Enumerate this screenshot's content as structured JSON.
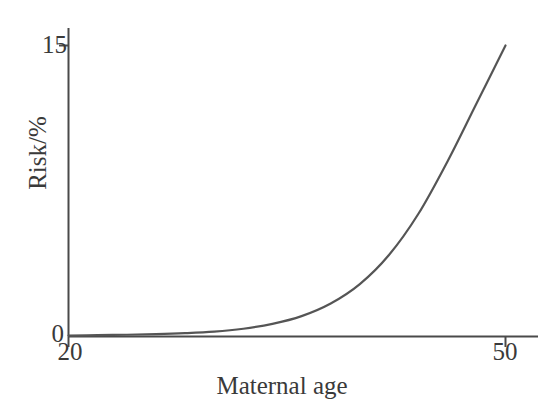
{
  "figure": {
    "width": 554,
    "height": 420,
    "background_color": "#ffffff",
    "axis_color": "#4a4a4a",
    "text_color": "#3a3a3a"
  },
  "chart_data": {
    "type": "line",
    "title": "",
    "subtitle": "",
    "xlabel": "Maternal age",
    "ylabel": "Risk/%",
    "xlim": [
      20,
      50
    ],
    "ylim": [
      0,
      15
    ],
    "xticks": [
      20,
      50
    ],
    "xtick_labels": [
      "20",
      "50"
    ],
    "yticks": [
      0,
      15
    ],
    "ytick_labels": [
      "0",
      "15"
    ],
    "grid": false,
    "legend": null,
    "legend_position": "none",
    "line_color": "#555555",
    "line_width": 2,
    "annotations": [],
    "series": [
      {
        "name": "Risk of chromosomal abnormality",
        "x": [
          20,
          22,
          24,
          26,
          28,
          30,
          32,
          34,
          36,
          38,
          40,
          42,
          44,
          46,
          48,
          50
        ],
        "values": [
          0.05,
          0.07,
          0.09,
          0.12,
          0.17,
          0.25,
          0.4,
          0.65,
          1.05,
          1.7,
          2.7,
          4.2,
          6.3,
          9.0,
          12.0,
          15.0
        ]
      }
    ]
  },
  "axes": {
    "y_axis_label": "Risk/%",
    "x_axis_label": "Maternal age",
    "y_tick_top": "15",
    "y_tick_bottom": "0",
    "x_tick_left": "20",
    "x_tick_right": "50"
  }
}
